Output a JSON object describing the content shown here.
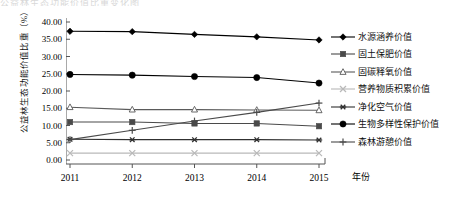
{
  "top_sliver_text": "公益林生态功能价值比重变化图",
  "axes": {
    "y_title": "公益林生态功能价值比重（%）",
    "x_title": "年份",
    "y_ticks": [
      "0.00",
      "5.00",
      "10.00",
      "15.00",
      "20.00",
      "25.00",
      "30.00",
      "35.00",
      "40.00"
    ],
    "x_ticks": [
      "2011",
      "2012",
      "2013",
      "2014",
      "2015"
    ]
  },
  "legend": {
    "items": [
      {
        "label": "水源涵养价值",
        "marker": "diamond-marker",
        "color": "#000000"
      },
      {
        "label": "固土保肥价值",
        "marker": "square-marker",
        "color": "#4a4a4a"
      },
      {
        "label": "固碳释氧价值",
        "marker": "triangle-marker",
        "color": "#5a5a5a"
      },
      {
        "label": "营养物质积累价值",
        "marker": "cross-x-marker",
        "color": "#b9b9b9"
      },
      {
        "label": "净化空气价值",
        "marker": "asterisk-marker",
        "color": "#303030"
      },
      {
        "label": "生物多样性保护价值",
        "marker": "circle-marker",
        "color": "#000000"
      },
      {
        "label": "森林游憩价值",
        "marker": "plus-marker",
        "color": "#4a4a4a"
      }
    ]
  },
  "chart_data": {
    "type": "line",
    "title": "",
    "xlabel": "年份",
    "ylabel": "公益林生态功能价值比重（%）",
    "categories": [
      "2011",
      "2012",
      "2013",
      "2014",
      "2015"
    ],
    "ylim": [
      0,
      40
    ],
    "ytick_step": 5,
    "grid": false,
    "legend_position": "right",
    "series": [
      {
        "name": "水源涵养价值",
        "marker": "diamond",
        "color": "#000000",
        "values": [
          37.3,
          37.2,
          36.4,
          35.7,
          34.8
        ]
      },
      {
        "name": "固土保肥价值",
        "marker": "square",
        "color": "#4a4a4a",
        "values": [
          11.0,
          11.0,
          10.6,
          10.6,
          9.8
        ]
      },
      {
        "name": "固碳释氧价值",
        "marker": "triangle",
        "color": "#5a5a5a",
        "values": [
          15.3,
          14.6,
          14.6,
          14.5,
          14.4
        ]
      },
      {
        "name": "营养物质积累价值",
        "marker": "cross-x",
        "color": "#b9b9b9",
        "values": [
          2.0,
          2.0,
          2.0,
          2.0,
          2.0
        ]
      },
      {
        "name": "净化空气价值",
        "marker": "asterisk",
        "color": "#303030",
        "values": [
          6.0,
          5.9,
          5.9,
          5.9,
          5.8
        ]
      },
      {
        "name": "生物多样性保护价值",
        "marker": "circle",
        "color": "#000000",
        "values": [
          24.8,
          24.6,
          24.2,
          23.9,
          22.3
        ]
      },
      {
        "name": "森林游憩价值",
        "marker": "plus",
        "color": "#4a4a4a",
        "values": [
          5.9,
          8.6,
          11.3,
          13.8,
          16.5
        ]
      }
    ]
  }
}
